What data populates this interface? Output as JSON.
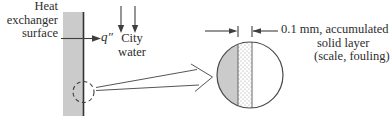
{
  "figure": {
    "type": "heat-exchanger-fouling-diagram",
    "labels": {
      "surface": "Heat\nexchanger\nsurface",
      "heat_flux": "q″",
      "city_water": "City\nwater"
    },
    "magnified_view": {
      "dimension_label_line1": "0.1 mm, accumulated",
      "dimension_label_line2": "solid layer",
      "dimension_label_line3": "(scale, fouling)"
    },
    "colors": {
      "wall_fill": "#cbcbcb",
      "stroke": "#3f3f3f",
      "text": "#2d2d2d",
      "background": "#ffffff"
    }
  }
}
